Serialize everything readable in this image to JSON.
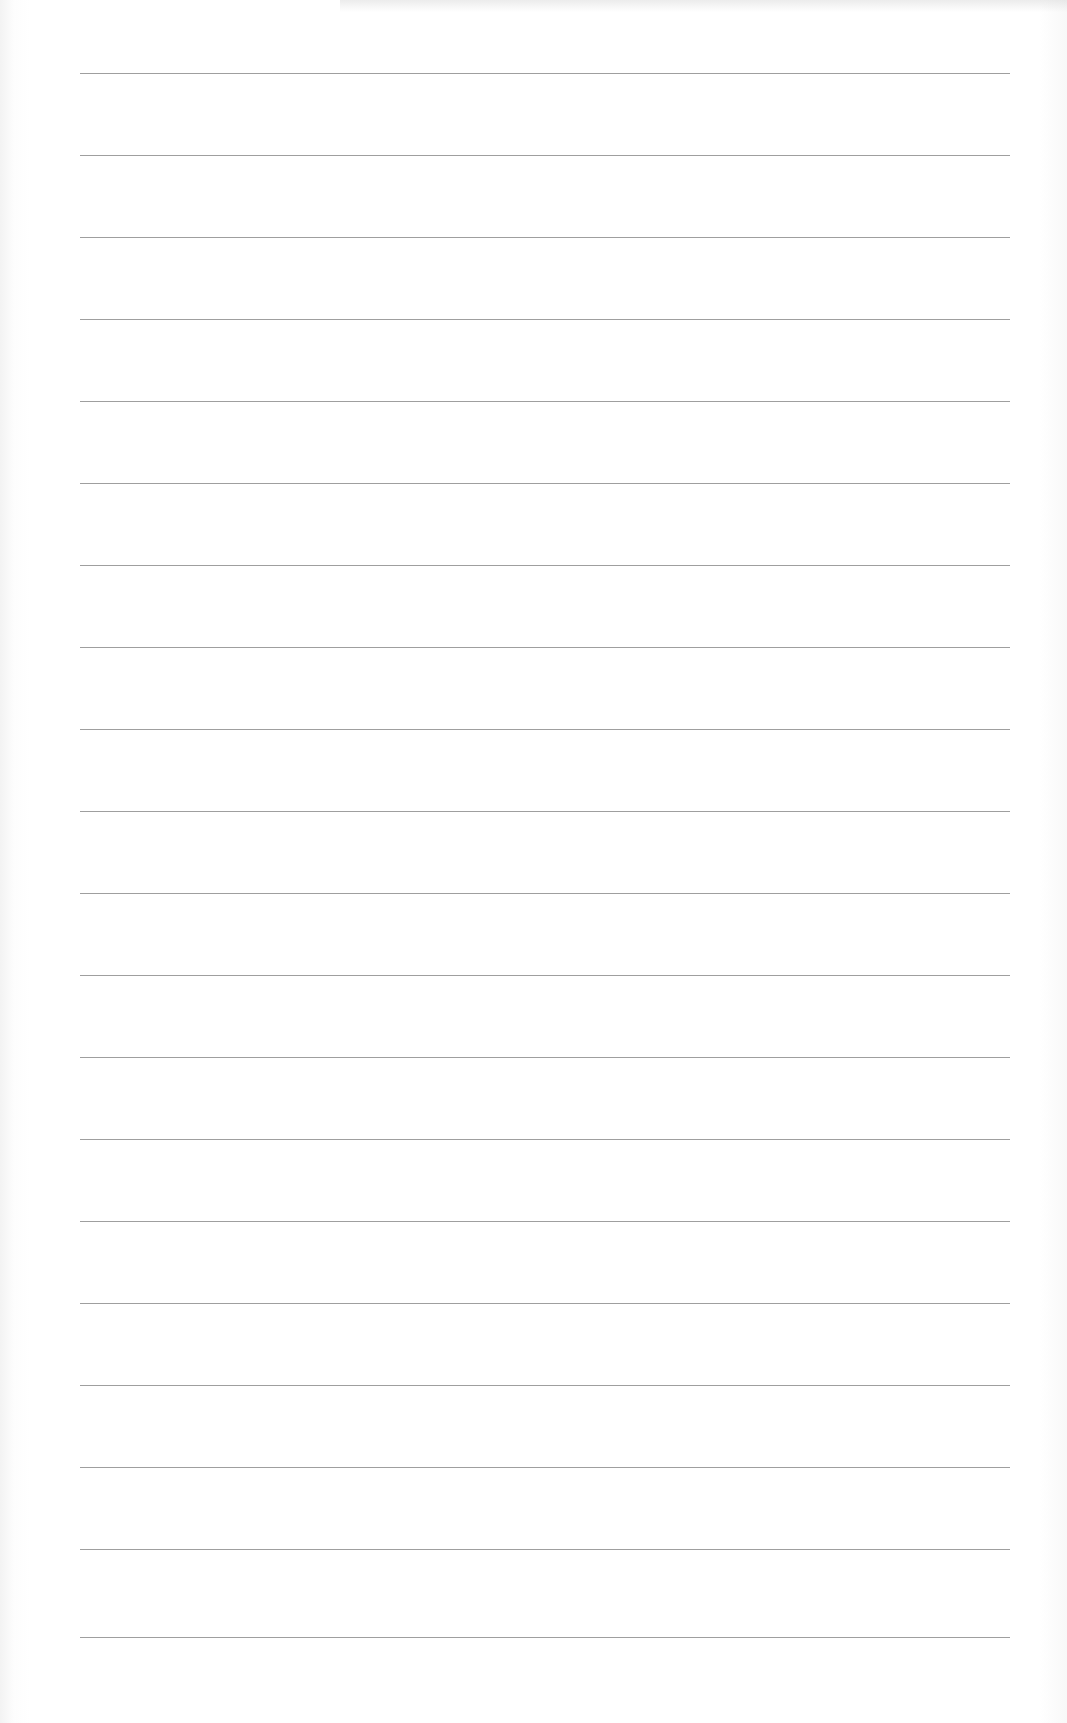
{
  "document": {
    "type": "lined-paper",
    "background_color": "#ffffff",
    "line_color": "#8e8e8e",
    "line_count": 20,
    "first_line_y": 73,
    "line_spacing": 82,
    "line_left": 80,
    "line_width": 930
  },
  "lines": [
    {
      "text": ""
    },
    {
      "text": ""
    },
    {
      "text": ""
    },
    {
      "text": ""
    },
    {
      "text": ""
    },
    {
      "text": ""
    },
    {
      "text": ""
    },
    {
      "text": ""
    },
    {
      "text": ""
    },
    {
      "text": ""
    },
    {
      "text": ""
    },
    {
      "text": ""
    },
    {
      "text": ""
    },
    {
      "text": ""
    },
    {
      "text": ""
    },
    {
      "text": ""
    },
    {
      "text": ""
    },
    {
      "text": ""
    },
    {
      "text": ""
    },
    {
      "text": ""
    }
  ]
}
